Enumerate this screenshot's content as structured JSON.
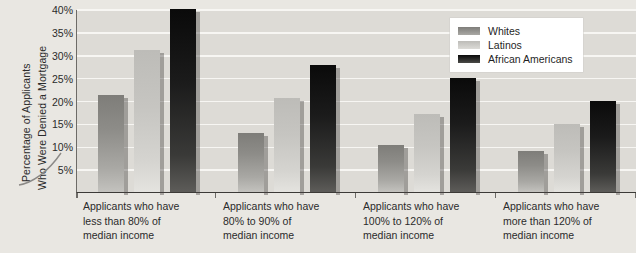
{
  "chart_data": {
    "type": "bar",
    "title": "",
    "xlabel": "",
    "ylabel_line1": "Percentage of Applicants",
    "ylabel_line2": "Who Were Denied a Mortgage",
    "ylim": [
      0,
      40
    ],
    "ytick_values": [
      5,
      10,
      15,
      20,
      25,
      30,
      35,
      40
    ],
    "ytick_labels": [
      "5%",
      "10%",
      "15%",
      "20%",
      "25%",
      "30%",
      "35%",
      "40%"
    ],
    "grid": true,
    "legend_position": "top-right",
    "categories": [
      "Applicants who have less than 80% of median income",
      "Applicants who have 80% to 90% of median income",
      "Applicants who have 100% to 120% of median income",
      "Applicants who have more than 120% of median income"
    ],
    "category_lines": [
      [
        "Applicants who have",
        "less than 80% of",
        "median income"
      ],
      [
        "Applicants who have",
        "80% to 90% of",
        "median income"
      ],
      [
        "Applicants who have",
        "100% to 120% of",
        "median income"
      ],
      [
        "Applicants who have",
        "more than 120% of",
        "median income"
      ]
    ],
    "series": [
      {
        "name": "Whites",
        "color": "#8a8a86",
        "values": [
          21.2,
          13.0,
          10.3,
          9.0
        ]
      },
      {
        "name": "Latinos",
        "color": "#c8c7c3",
        "values": [
          31.0,
          20.6,
          17.0,
          14.8
        ]
      },
      {
        "name": "African Americans",
        "color": "#1a1a1a",
        "values": [
          40.0,
          27.8,
          24.9,
          20.0
        ]
      }
    ]
  },
  "colors": {
    "canvas_background": "#e9e7e2",
    "plot_background": "#dddbd6",
    "gridline": "#f7f6f3",
    "axis": "#3c3a37",
    "text": "#2b2b2b",
    "legend_background": "#ffffff"
  }
}
